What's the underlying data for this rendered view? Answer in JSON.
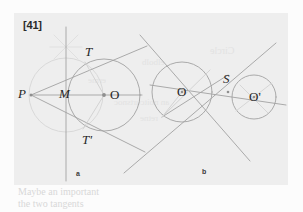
{
  "figure": {
    "number_label": "[41]",
    "panel": {
      "left": 14,
      "top": 13,
      "width": 274,
      "height": 172,
      "paper_color": "#eeeeee"
    },
    "ink_color": "#9a9a9a",
    "label_color": "#262626",
    "subfigures": [
      {
        "key": "a",
        "label": "a",
        "label_x": 76,
        "label_y": 172
      },
      {
        "key": "b",
        "label": "b",
        "label_x": 202,
        "label_y": 170
      }
    ]
  },
  "diagram_a": {
    "caption": "a",
    "description": "Tangents from external point P to circle with center O; tangent points T and T'; M is midpoint of PO with perpendicular bisector",
    "points": [
      {
        "name": "P",
        "label": "P",
        "x": 31,
        "y": 95,
        "label_x": 18,
        "label_y": 87,
        "italic": true
      },
      {
        "name": "M",
        "label": "M",
        "x": 66,
        "y": 95,
        "label_x": 59,
        "label_y": 87,
        "italic": true
      },
      {
        "name": "O",
        "label": "O",
        "x": 104,
        "y": 95,
        "label_x": 110,
        "label_y": 88,
        "italic": false
      },
      {
        "name": "T",
        "label": "T",
        "x": 85,
        "y": 62,
        "label_x": 85,
        "label_y": 45,
        "italic": true
      },
      {
        "name": "Tp",
        "label": "T'",
        "x": 83,
        "y": 129,
        "label_x": 82,
        "label_y": 133,
        "italic": true
      }
    ],
    "circle": {
      "cx": 104,
      "cy": 95,
      "r": 36
    },
    "construction_circle": {
      "cx": 66,
      "cy": 95,
      "r": 37
    }
  },
  "diagram_b": {
    "caption": "b",
    "description": "Two circles, centers O and O', internal center of similitude S on line of centers with common internal tangents",
    "points": [
      {
        "name": "O",
        "label": "O",
        "x": 182,
        "y": 92,
        "label_x": 177,
        "label_y": 85,
        "italic": false
      },
      {
        "name": "S",
        "label": "S",
        "x": 228,
        "y": 92,
        "label_x": 223,
        "label_y": 72,
        "italic": true
      },
      {
        "name": "Op",
        "label": "O'",
        "x": 254,
        "y": 97,
        "label_x": 249,
        "label_y": 90,
        "italic": false
      }
    ],
    "circle_large": {
      "cx": 182,
      "cy": 92,
      "r": 30
    },
    "circle_small": {
      "cx": 254,
      "cy": 97,
      "r": 22
    }
  },
  "bleed_text": {
    "description": "faint mirrored show-through text from the reverse side of the scanned page",
    "lines": [
      {
        "text": "Circle Is",
        "x": 205,
        "y": 30,
        "size": 13,
        "mirror": false,
        "weight": "normal"
      },
      {
        "text": "erme",
        "x": 95,
        "y": 78,
        "size": 11,
        "mirror": true,
        "weight": "normal"
      },
      {
        "text": "Circle",
        "x": 228,
        "y": 54,
        "size": 9,
        "mirror": true,
        "weight": "normal"
      },
      {
        "text": "elbolb",
        "x": 150,
        "y": 60,
        "size": 9,
        "mirror": true,
        "weight": "normal"
      },
      {
        "text": "an noitcurtsnoc",
        "x": 120,
        "y": 100,
        "size": 9,
        "mirror": true,
        "weight": "normal"
      },
      {
        "text": "retne",
        "x": 148,
        "y": 116,
        "size": 9,
        "mirror": true,
        "weight": "normal"
      },
      {
        "text": "the two tangents",
        "x": 20,
        "y": 196,
        "size": 10,
        "mirror": false,
        "weight": "normal"
      },
      {
        "text": "Maybe an important",
        "x": 20,
        "y": 183,
        "size": 10,
        "mirror": false,
        "weight": "normal"
      }
    ]
  }
}
